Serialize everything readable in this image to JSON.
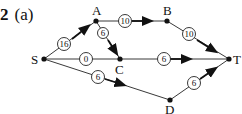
{
  "question": {
    "number": "2",
    "part": "(a)"
  },
  "nodes": [
    {
      "id": "S",
      "label": "S"
    },
    {
      "id": "A",
      "label": "A"
    },
    {
      "id": "B",
      "label": "B"
    },
    {
      "id": "C",
      "label": "C"
    },
    {
      "id": "D",
      "label": "D"
    },
    {
      "id": "T",
      "label": "T"
    }
  ],
  "edges": [
    {
      "from": "S",
      "to": "A",
      "weight": "16"
    },
    {
      "from": "A",
      "to": "B",
      "weight": "10"
    },
    {
      "from": "B",
      "to": "T",
      "weight": "10"
    },
    {
      "from": "A",
      "to": "C",
      "weight": "6"
    },
    {
      "from": "S",
      "to": "C",
      "weight": "0"
    },
    {
      "from": "C",
      "to": "T",
      "weight": "6"
    },
    {
      "from": "S",
      "to": "D",
      "weight": "6"
    },
    {
      "from": "D",
      "to": "T",
      "weight": "6"
    }
  ]
}
